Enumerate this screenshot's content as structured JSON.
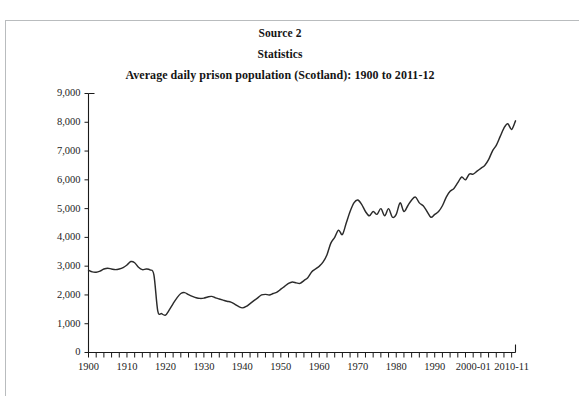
{
  "document": {
    "source_label": "Source 2",
    "section_label": "Statistics"
  },
  "chart_data": {
    "type": "line",
    "title": "Average daily prison population (Scotland): 1900 to 2011-12",
    "xlabel": "",
    "ylabel": "",
    "xlim": [
      1900,
      2011
    ],
    "ylim": [
      0,
      9000
    ],
    "ytick_step": 1000,
    "xtick_step": 2,
    "grid": false,
    "legend": null,
    "ytick_labels": [
      "0",
      "1,000",
      "2,000",
      "3,000",
      "4,000",
      "5,000",
      "6,000",
      "7,000",
      "8,000",
      "9,000"
    ],
    "ytick_values": [
      0,
      1000,
      2000,
      3000,
      4000,
      5000,
      6000,
      7000,
      8000,
      9000
    ],
    "xtick_labels": [
      "1900",
      "1910",
      "1920",
      "1930",
      "1940",
      "1950",
      "1960",
      "1970",
      "1980",
      "1990",
      "2000-01",
      "2010-11"
    ],
    "xtick_label_values": [
      1900,
      1910,
      1920,
      1930,
      1940,
      1950,
      1960,
      1970,
      1980,
      1990,
      2000,
      2010
    ],
    "line_color": "#2b2b2b",
    "series": [
      {
        "name": "Average daily prison population (Scotland)",
        "x": [
          1900,
          1901,
          1902,
          1903,
          1904,
          1905,
          1906,
          1907,
          1908,
          1909,
          1910,
          1911,
          1912,
          1913,
          1914,
          1915,
          1916,
          1917,
          1918,
          1919,
          1920,
          1921,
          1922,
          1923,
          1924,
          1925,
          1926,
          1927,
          1928,
          1929,
          1930,
          1931,
          1932,
          1933,
          1934,
          1935,
          1936,
          1937,
          1938,
          1939,
          1940,
          1941,
          1942,
          1943,
          1944,
          1945,
          1946,
          1947,
          1948,
          1949,
          1950,
          1951,
          1952,
          1953,
          1954,
          1955,
          1956,
          1957,
          1958,
          1959,
          1960,
          1961,
          1962,
          1963,
          1964,
          1965,
          1966,
          1967,
          1968,
          1969,
          1970,
          1971,
          1972,
          1973,
          1974,
          1975,
          1976,
          1977,
          1978,
          1979,
          1980,
          1981,
          1982,
          1983,
          1984,
          1985,
          1986,
          1987,
          1988,
          1989,
          1990,
          1991,
          1992,
          1993,
          1994,
          1995,
          1996,
          1997,
          1998,
          1999,
          2000,
          2001,
          2002,
          2003,
          2004,
          2005,
          2006,
          2007,
          2008,
          2009,
          2010,
          2011
        ],
        "values": [
          2860,
          2800,
          2790,
          2830,
          2900,
          2930,
          2900,
          2880,
          2900,
          2950,
          3040,
          3160,
          3120,
          2960,
          2880,
          2900,
          2870,
          2700,
          1450,
          1350,
          1300,
          1480,
          1700,
          1900,
          2050,
          2080,
          2010,
          1950,
          1900,
          1880,
          1890,
          1930,
          1950,
          1900,
          1860,
          1820,
          1780,
          1750,
          1680,
          1600,
          1550,
          1600,
          1700,
          1800,
          1900,
          2000,
          2020,
          2000,
          2050,
          2100,
          2200,
          2300,
          2400,
          2450,
          2420,
          2400,
          2500,
          2600,
          2800,
          2900,
          3000,
          3150,
          3400,
          3800,
          4000,
          4250,
          4100,
          4500,
          4900,
          5200,
          5300,
          5150,
          4900,
          4750,
          4900,
          4800,
          5000,
          4750,
          5000,
          4700,
          4800,
          5200,
          4900,
          5100,
          5300,
          5400,
          5200,
          5100,
          4900,
          4700,
          4800,
          4900,
          5100,
          5400,
          5600,
          5700,
          5900,
          6100,
          6000,
          6200,
          6200,
          6300,
          6400,
          6500,
          6700,
          7000,
          7200,
          7500,
          7800,
          7950,
          7750,
          8050
        ]
      }
    ],
    "annotations": [
      {
        "text": "Peak around 1970 near 5,300"
      },
      {
        "text": "Trough around 1919-20 near 1,300"
      },
      {
        "text": "Final value 2011-12 near 8,000"
      }
    ]
  }
}
